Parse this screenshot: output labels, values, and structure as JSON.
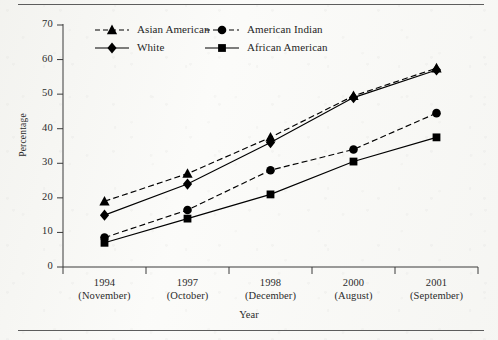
{
  "chart_data": {
    "type": "line",
    "title": "",
    "xlabel": "Year",
    "ylabel": "Percentage",
    "ylim": [
      0,
      70
    ],
    "yticks": [
      0,
      10,
      20,
      30,
      40,
      50,
      60,
      70
    ],
    "grid": false,
    "legend_position": "top-left-inside",
    "categories": [
      "1994",
      "1997",
      "1998",
      "2000",
      "2001"
    ],
    "category_sublabels": [
      "(November)",
      "(October)",
      "(December)",
      "(August)",
      "(September)"
    ],
    "series": [
      {
        "name": "Asian American",
        "marker": "triangle",
        "line_style": "dashed",
        "color": "#000000",
        "values": [
          19,
          27,
          37.5,
          49.5,
          57.5
        ]
      },
      {
        "name": "White",
        "marker": "diamond",
        "line_style": "solid",
        "color": "#000000",
        "values": [
          15,
          24,
          36,
          49,
          57
        ]
      },
      {
        "name": "American Indian",
        "marker": "circle",
        "line_style": "dashed",
        "color": "#000000",
        "values": [
          8.5,
          16.5,
          28,
          34,
          44.5
        ]
      },
      {
        "name": "African American",
        "marker": "square",
        "line_style": "solid",
        "color": "#000000",
        "values": [
          7,
          14,
          21,
          30.5,
          37.5
        ]
      }
    ]
  },
  "axis": {
    "y_title": "Percentage",
    "x_title": "Year",
    "y_tick_labels": [
      "0",
      "10",
      "20",
      "30",
      "40",
      "50",
      "60",
      "70"
    ]
  },
  "legend": {
    "entries": [
      {
        "label": "Asian American"
      },
      {
        "label": "American Indian"
      },
      {
        "label": "White"
      },
      {
        "label": "African American"
      }
    ]
  }
}
